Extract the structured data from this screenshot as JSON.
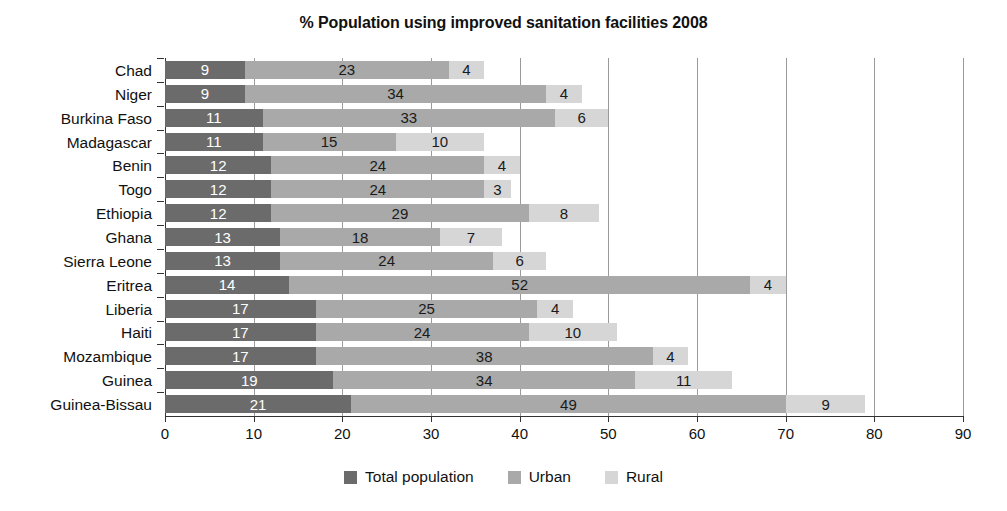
{
  "chart_data": {
    "type": "bar",
    "subtype": "stacked-horizontal-bar",
    "title": "% Population using improved sanitation facilities 2008",
    "xlabel": "",
    "ylabel": "",
    "xlim": [
      0,
      90
    ],
    "xticks": [
      0,
      10,
      20,
      30,
      40,
      50,
      60,
      70,
      80,
      90
    ],
    "grid": true,
    "grid_axis": "x",
    "legend_position": "bottom",
    "categories": [
      "Chad",
      "Niger",
      "Burkina Faso",
      "Madagascar",
      "Benin",
      "Togo",
      "Ethiopia",
      "Ghana",
      "Sierra Leone",
      "Eritrea",
      "Liberia",
      "Haiti",
      "Mozambique",
      "Guinea",
      "Guinea-Bissau"
    ],
    "series": [
      {
        "name": "Total population",
        "color": "#6b6b6b",
        "values": [
          9,
          9,
          11,
          11,
          12,
          12,
          12,
          13,
          13,
          14,
          17,
          17,
          17,
          19,
          21
        ]
      },
      {
        "name": "Urban",
        "color": "#a9a9a9",
        "values": [
          23,
          34,
          33,
          15,
          24,
          24,
          29,
          18,
          24,
          52,
          25,
          24,
          38,
          34,
          49
        ]
      },
      {
        "name": "Rural",
        "color": "#d6d6d6",
        "values": [
          4,
          4,
          6,
          10,
          4,
          3,
          8,
          7,
          6,
          4,
          4,
          10,
          4,
          11,
          9
        ]
      }
    ]
  },
  "legend": {
    "items": [
      {
        "label": "Total population",
        "swatch": "sw-total"
      },
      {
        "label": "Urban",
        "swatch": "sw-urban"
      },
      {
        "label": "Rural",
        "swatch": "sw-rural"
      }
    ]
  }
}
